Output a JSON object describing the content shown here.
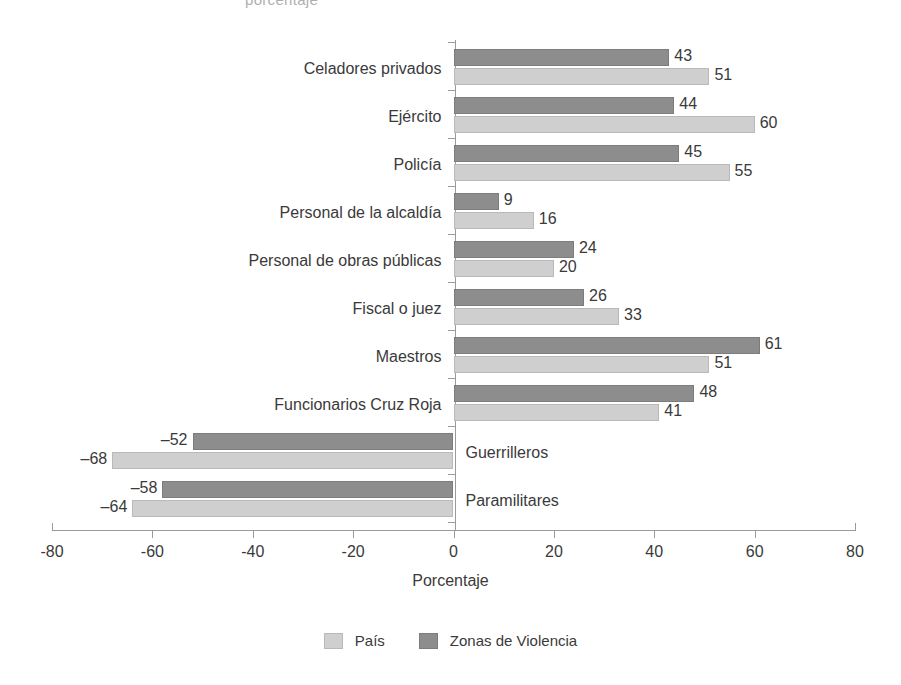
{
  "figure": {
    "title_sliver": "porcentaje",
    "x_axis_title": "Porcentaje",
    "legend_position": "bottom-center"
  },
  "chart_data": {
    "type": "bar",
    "orientation": "horizontal",
    "title": "",
    "xlabel": "Porcentaje",
    "ylabel": "",
    "xlim": [
      -80,
      80
    ],
    "xticks": [
      -80,
      -60,
      -40,
      -20,
      0,
      20,
      40,
      60,
      80
    ],
    "xticklabels": [
      "-80",
      "-60",
      "-40",
      "-20",
      "0",
      "20",
      "40",
      "60",
      "80"
    ],
    "grid": false,
    "categories": [
      "Celadores privados",
      "Ejército",
      "Policía",
      "Personal de la alcaldía",
      "Personal de obras públicas",
      "Fiscal o juez",
      "Maestros",
      "Funcionarios Cruz Roja",
      "Guerrilleros",
      "Paramilitares"
    ],
    "series": [
      {
        "name": "Zonas de Violencia",
        "color": "#8d8d8d",
        "values": [
          43,
          44,
          45,
          9,
          24,
          26,
          61,
          48,
          -52,
          -58
        ],
        "labels": [
          "43",
          "44",
          "45",
          "9",
          "24",
          "26",
          "61",
          "48",
          "–52",
          "–58"
        ]
      },
      {
        "name": "País",
        "color": "#cfcfcf",
        "values": [
          51,
          60,
          55,
          16,
          20,
          33,
          51,
          41,
          -68,
          -64
        ],
        "labels": [
          "51",
          "60",
          "55",
          "16",
          "20",
          "33",
          "51",
          "41",
          "–68",
          "–64"
        ]
      }
    ],
    "legend": [
      "País",
      "Zonas de Violencia"
    ]
  }
}
